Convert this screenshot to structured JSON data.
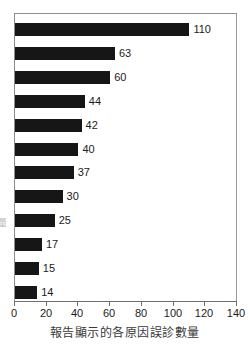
{
  "caption": "報告顯示的各原因誤診數量",
  "ylabel_fragment": "量",
  "chart_data": {
    "type": "bar",
    "orientation": "horizontal",
    "title": "",
    "subtitle": "",
    "xlabel": "報告顯示的各原因誤診數量",
    "ylabel": "",
    "categories": [
      "",
      "",
      "",
      "",
      "",
      "",
      "",
      "",
      "",
      "",
      "",
      ""
    ],
    "values": [
      110,
      63,
      60,
      44,
      42,
      40,
      37,
      30,
      25,
      17,
      15,
      14
    ],
    "data_labels": [
      "110",
      "63",
      "60",
      "44",
      "42",
      "40",
      "37",
      "30",
      "25",
      "17",
      "15",
      "14"
    ],
    "xlim": [
      0,
      140
    ],
    "xticks": [
      0,
      20,
      40,
      60,
      80,
      100,
      120,
      140
    ],
    "xticklabels": [
      "0",
      "20",
      "40",
      "60",
      "80",
      "100",
      "120",
      "140"
    ],
    "grid": false,
    "legend": false,
    "bar_color": "#161616",
    "frame_color": "#8d8d8d",
    "background": "#ffffff"
  }
}
